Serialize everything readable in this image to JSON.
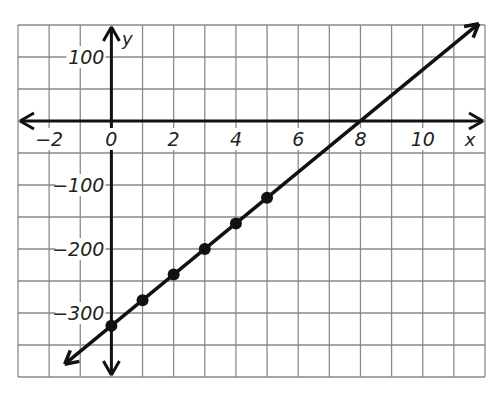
{
  "chart_data": {
    "type": "line",
    "title": "",
    "xlabel": "x",
    "ylabel": "y",
    "xlim": [
      -3,
      12
    ],
    "ylim": [
      -400,
      150
    ],
    "grid": true,
    "x_grid_step": 1,
    "y_grid_step": 50,
    "x_ticks": [
      {
        "value": -2,
        "label": "−2"
      },
      {
        "value": 0,
        "label": "0"
      },
      {
        "value": 2,
        "label": "2"
      },
      {
        "value": 4,
        "label": "4"
      },
      {
        "value": 6,
        "label": "6"
      },
      {
        "value": 8,
        "label": "8"
      },
      {
        "value": 10,
        "label": "10"
      }
    ],
    "y_ticks": [
      {
        "value": 100,
        "label": "100"
      },
      {
        "value": -100,
        "label": "−100"
      },
      {
        "value": -200,
        "label": "−200"
      },
      {
        "value": -300,
        "label": "−300"
      }
    ],
    "series": [
      {
        "name": "y = 40x − 320",
        "slope": 40,
        "intercept": -320,
        "x": [
          0,
          1,
          2,
          3,
          4,
          5
        ],
        "values": [
          -320,
          -280,
          -240,
          -200,
          -160,
          -120
        ],
        "line_extends": {
          "from_x": -1.5,
          "to_x": 11.8
        }
      }
    ],
    "colors": {
      "line": "#111111",
      "grid": "#8a8a8a",
      "axis": "#111111"
    }
  }
}
